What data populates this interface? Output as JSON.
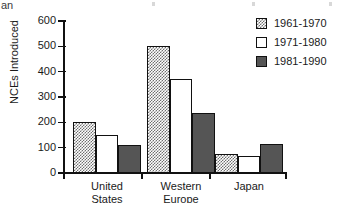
{
  "crop_fragment": "an",
  "chart_data": {
    "type": "bar",
    "title": "",
    "xlabel": "",
    "ylabel": "NCEs Introduced",
    "categories": [
      "United\nStates",
      "Western\nEurope",
      "Japan"
    ],
    "series": [
      {
        "name": "1961-1970",
        "fill": "hatch",
        "color": "#6f6f6f",
        "values": [
          200,
          500,
          75
        ]
      },
      {
        "name": "1971-1980",
        "fill": "white",
        "color": "#ffffff",
        "values": [
          150,
          370,
          68
        ]
      },
      {
        "name": "1981-1990",
        "fill": "dark",
        "color": "#555555",
        "values": [
          110,
          235,
          115
        ]
      }
    ],
    "ylim": [
      0,
      600
    ],
    "yticks": [
      0,
      100,
      200,
      300,
      400,
      500,
      600
    ],
    "ytick_labels": [
      "0",
      "100",
      "200",
      "300",
      "400",
      "500",
      "600"
    ],
    "grid": false,
    "legend_position": "top-right"
  },
  "legend": {
    "entries": [
      {
        "label": "1961-1970"
      },
      {
        "label": "1971-1980"
      },
      {
        "label": "1981-1990"
      }
    ]
  }
}
